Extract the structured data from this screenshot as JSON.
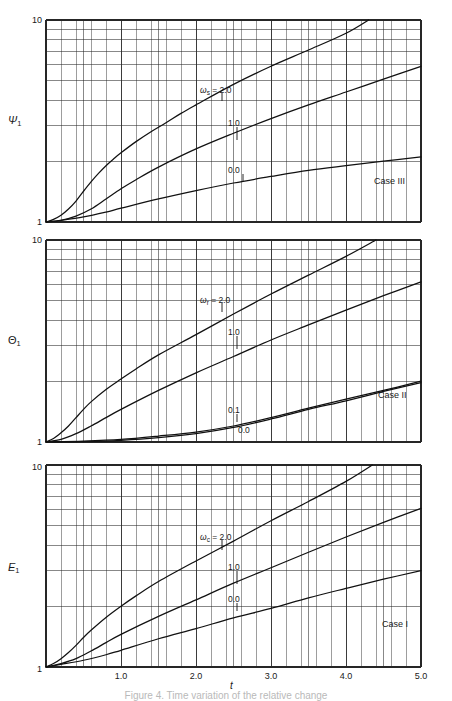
{
  "figure": {
    "caption": "Figure 4. Time variation of the relative change",
    "xaxis_title": "t",
    "xticks": [
      "1.0",
      "2.0",
      "3.0",
      "4.0",
      "5.0"
    ],
    "ytop": "10",
    "ybottom": "1"
  },
  "panels": [
    {
      "id": "panel-top",
      "ylabel_text": "Ψ",
      "ylabel_sub": "1",
      "case": "Case III",
      "param_symbol": "ω",
      "param_sub": "s",
      "curve_labels": [
        "= 2.0",
        "1.0",
        "0.0"
      ]
    },
    {
      "id": "panel-middle",
      "ylabel_text": "Θ",
      "ylabel_sub": "1",
      "case": "Case II",
      "param_symbol": "ω",
      "param_sub": "r",
      "curve_labels": [
        "= 2.0",
        "1.0",
        "0.1",
        "0.0"
      ]
    },
    {
      "id": "panel-bottom",
      "ylabel_text": "E",
      "ylabel_sub": "1",
      "case": "Case I",
      "param_symbol": "ω",
      "param_sub": "c",
      "curve_labels": [
        "= 2.0",
        "1.0",
        "0.0"
      ]
    }
  ],
  "chart_data": [
    {
      "type": "line",
      "title": "Case III",
      "xlabel": "t",
      "ylabel": "Ψ₁",
      "xlim": [
        0,
        5.0
      ],
      "ylim": [
        1,
        10
      ],
      "yscale": "log",
      "xscale": "linear",
      "grid": true,
      "legend_position": "inline-annotation",
      "series": [
        {
          "name": "ω_s = 2.0",
          "x": [
            0.0,
            0.1,
            0.2,
            0.3,
            0.4,
            0.5,
            0.6,
            0.7,
            0.8,
            0.9,
            1.0,
            1.2,
            1.4,
            1.6,
            1.8,
            2.0,
            2.5,
            3.0,
            3.5,
            4.0,
            4.3
          ],
          "y": [
            1.0,
            1.03,
            1.08,
            1.16,
            1.27,
            1.42,
            1.58,
            1.74,
            1.9,
            2.05,
            2.2,
            2.5,
            2.8,
            3.1,
            3.45,
            3.8,
            4.8,
            5.9,
            7.1,
            8.6,
            10.0
          ]
        },
        {
          "name": "ω_s = 1.0",
          "x": [
            0.0,
            0.2,
            0.4,
            0.6,
            0.8,
            1.0,
            1.2,
            1.5,
            2.0,
            2.5,
            3.0,
            3.5,
            4.0,
            4.5,
            5.0
          ],
          "y": [
            1.0,
            1.02,
            1.07,
            1.16,
            1.3,
            1.46,
            1.62,
            1.87,
            2.3,
            2.75,
            3.25,
            3.8,
            4.4,
            5.1,
            5.9
          ]
        },
        {
          "name": "ω_s = 0.0",
          "x": [
            0.0,
            0.2,
            0.5,
            0.8,
            1.0,
            1.5,
            2.0,
            2.5,
            3.0,
            3.5,
            4.0,
            4.5,
            5.0
          ],
          "y": [
            1.0,
            1.02,
            1.06,
            1.12,
            1.17,
            1.3,
            1.43,
            1.56,
            1.68,
            1.8,
            1.9,
            2.0,
            2.1
          ]
        }
      ]
    },
    {
      "type": "line",
      "title": "Case II",
      "xlabel": "t",
      "ylabel": "Θ₁",
      "xlim": [
        0,
        5.0
      ],
      "ylim": [
        1,
        10
      ],
      "yscale": "log",
      "xscale": "linear",
      "grid": true,
      "legend_position": "inline-annotation",
      "series": [
        {
          "name": "ω_r = 2.0",
          "x": [
            0.0,
            0.1,
            0.2,
            0.3,
            0.4,
            0.5,
            0.6,
            0.8,
            1.0,
            1.2,
            1.5,
            2.0,
            2.5,
            3.0,
            3.5,
            4.0,
            4.4
          ],
          "y": [
            1.0,
            1.04,
            1.11,
            1.2,
            1.32,
            1.45,
            1.58,
            1.82,
            2.05,
            2.3,
            2.7,
            3.4,
            4.3,
            5.4,
            6.7,
            8.3,
            10.0
          ]
        },
        {
          "name": "ω_r = 1.0",
          "x": [
            0.0,
            0.2,
            0.4,
            0.6,
            0.8,
            1.0,
            1.5,
            2.0,
            2.5,
            3.0,
            3.5,
            4.0,
            4.5,
            5.0
          ],
          "y": [
            1.0,
            1.03,
            1.1,
            1.2,
            1.32,
            1.45,
            1.8,
            2.2,
            2.65,
            3.2,
            3.8,
            4.5,
            5.3,
            6.2
          ]
        },
        {
          "name": "ω_r = 0.1",
          "x": [
            0.0,
            0.5,
            1.0,
            1.5,
            2.0,
            2.5,
            3.0,
            3.5,
            4.0,
            4.5,
            5.0
          ],
          "y": [
            1.0,
            1.01,
            1.03,
            1.07,
            1.12,
            1.2,
            1.32,
            1.47,
            1.63,
            1.8,
            2.0
          ]
        },
        {
          "name": "ω_r = 0.0",
          "x": [
            0.0,
            0.5,
            1.0,
            1.5,
            2.0,
            2.5,
            3.0,
            3.5,
            4.0,
            4.5,
            5.0
          ],
          "y": [
            1.0,
            1.005,
            1.02,
            1.05,
            1.1,
            1.18,
            1.3,
            1.45,
            1.6,
            1.78,
            1.97
          ]
        }
      ]
    },
    {
      "type": "line",
      "title": "Case I",
      "xlabel": "t",
      "ylabel": "E₁",
      "xlim": [
        0,
        5.0
      ],
      "ylim": [
        1,
        10
      ],
      "yscale": "log",
      "xscale": "linear",
      "grid": true,
      "legend_position": "inline-annotation",
      "series": [
        {
          "name": "ω_c = 2.0",
          "x": [
            0.0,
            0.1,
            0.2,
            0.3,
            0.4,
            0.5,
            0.6,
            0.8,
            1.0,
            1.2,
            1.5,
            2.0,
            2.5,
            3.0,
            3.5,
            4.0,
            4.35
          ],
          "y": [
            1.0,
            1.04,
            1.1,
            1.18,
            1.28,
            1.4,
            1.52,
            1.76,
            2.0,
            2.25,
            2.65,
            3.35,
            4.2,
            5.3,
            6.6,
            8.3,
            10.0
          ]
        },
        {
          "name": "ω_c = 1.0",
          "x": [
            0.0,
            0.2,
            0.4,
            0.6,
            0.8,
            1.0,
            1.5,
            2.0,
            2.5,
            3.0,
            3.5,
            4.0,
            4.5,
            5.0
          ],
          "y": [
            1.0,
            1.04,
            1.1,
            1.2,
            1.32,
            1.45,
            1.78,
            2.15,
            2.6,
            3.1,
            3.7,
            4.4,
            5.2,
            6.1
          ]
        },
        {
          "name": "ω_c = 0.0",
          "x": [
            0.0,
            0.2,
            0.5,
            0.8,
            1.0,
            1.5,
            2.0,
            2.5,
            3.0,
            3.5,
            4.0,
            4.5,
            5.0
          ],
          "y": [
            1.0,
            1.03,
            1.08,
            1.15,
            1.21,
            1.38,
            1.55,
            1.75,
            1.95,
            2.2,
            2.45,
            2.72,
            3.0
          ]
        }
      ]
    }
  ]
}
